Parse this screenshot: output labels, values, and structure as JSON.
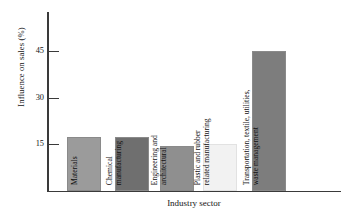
{
  "chart_data": {
    "type": "bar",
    "title": "",
    "xlabel": "Industry sector",
    "ylabel": "Influence on sales (%)",
    "ylim": [
      0,
      50
    ],
    "yticks": [
      15,
      30,
      45
    ],
    "ytick_labels": [
      "15",
      "30",
      "45"
    ],
    "grid": false,
    "legend": "none",
    "categories": [
      "Materials",
      "Chemical manufacturing",
      "Engineering and architectural",
      "Plastic and rubber related manufacturing",
      "Transportation, textile, utilities, waste management"
    ],
    "category_label_lines": [
      [
        "Materials"
      ],
      [
        "Chemical",
        "manufacturing"
      ],
      [
        "Engineering and",
        "architectural"
      ],
      [
        "Plastic and rubber",
        "related manufacturing"
      ],
      [
        "Transportation, textile, utilities,",
        "waste management"
      ]
    ],
    "values": [
      15,
      15,
      12.5,
      13,
      39
    ],
    "bar_colors": [
      "#9b9b9b",
      "#6f6f6f",
      "#8f8f8f",
      "#f2f2f2",
      "#7d7d7d"
    ]
  },
  "axis": {
    "y_title": "Influence on sales (%)",
    "x_title": "Industry sector",
    "tick_45": "45",
    "tick_30": "30",
    "tick_15": "15"
  },
  "bars": [
    {
      "name": "materials",
      "value": 15,
      "color": "#9b9b9b",
      "line1": "Materials",
      "line2": ""
    },
    {
      "name": "chemical-manufacturing",
      "value": 15,
      "color": "#6f6f6f",
      "line1": "Chemical",
      "line2": "manufacturing"
    },
    {
      "name": "engineering-and-architectural",
      "value": 12.5,
      "color": "#8f8f8f",
      "line1": "Engineering and",
      "line2": "architectural"
    },
    {
      "name": "plastic-and-rubber-related-manufacturing",
      "value": 13,
      "color": "#f2f2f2",
      "line1": "Plastic and rubber",
      "line2": "related manufacturing"
    },
    {
      "name": "transportation-textile-utilities-waste-management",
      "value": 39,
      "color": "#7d7d7d",
      "line1": "Transportation, textile, utilities,",
      "line2": "waste management"
    }
  ]
}
